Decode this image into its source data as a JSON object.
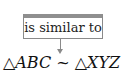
{
  "label": "is similar to",
  "equation": {
    "left_triangle_symbol": "△",
    "left_name": "ABC",
    "relation_symbol": "~",
    "right_triangle_symbol": "△",
    "right_name": "XYZ"
  },
  "colors": {
    "box_border": "#8a8a8a",
    "arrow": "#8a8a8a",
    "text": "#111111"
  }
}
